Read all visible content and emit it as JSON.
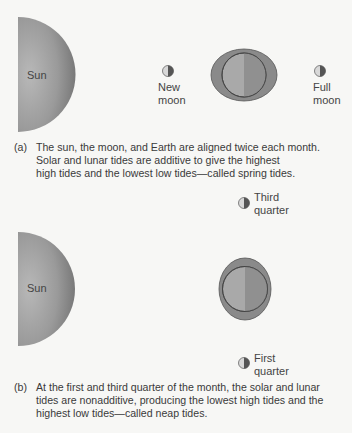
{
  "panel_a": {
    "sun_label": "Sun",
    "moon_left_label_line1": "New",
    "moon_left_label_line2": "moon",
    "moon_right_label_line1": "Full",
    "moon_right_label_line2": "moon",
    "caption_tag": "(a)",
    "caption_line1": "The sun, the moon, and Earth are aligned twice each month.",
    "caption_line2": "Solar and lunar tides are additive to give the highest",
    "caption_line3": "high tides and the lowest low tides—called spring tides."
  },
  "panel_b": {
    "sun_label": "Sun",
    "moon_top_label_line1": "Third",
    "moon_top_label_line2": "quarter",
    "moon_bottom_label_line1": "First",
    "moon_bottom_label_line2": "quarter",
    "caption_tag": "(b)",
    "caption_line1": "At the first and third quarter of the month, the solar and lunar",
    "caption_line2": "tides are nonadditive, producing the lowest high tides and the",
    "caption_line3": "highest low tides—called neap tides."
  },
  "colors": {
    "sun_light": "#b0b0b0",
    "sun_dark": "#7a7a7a",
    "tide_bulge": "#8a8a8a",
    "earth_light": "#a8a8a8",
    "earth_dark": "#8c8c8c",
    "outline": "#4a4a4a",
    "background": "#f7f7f5"
  }
}
